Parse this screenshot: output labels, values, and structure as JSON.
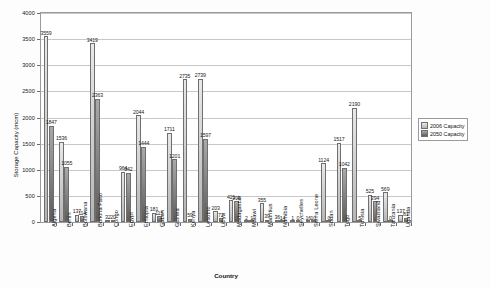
{
  "chart_data": {
    "type": "bar",
    "title": "",
    "xlabel": "Country",
    "ylabel": "Storage Capacity (mcm)",
    "ylim": [
      0,
      4000
    ],
    "ytick_step": 500,
    "yticks": [
      "0",
      "500",
      "1000",
      "1500",
      "2000",
      "2500",
      "3000",
      "3500",
      "4000"
    ],
    "grid": true,
    "legend_position": "right",
    "categories": [
      "Algeria",
      "Benin",
      "Botswana",
      "Burkina Faso",
      "Congo",
      "Egypt",
      "Ethiopia",
      "Gabon",
      "Guinea",
      "Kenya",
      "Lesotho",
      "Libya",
      "Madagascar",
      "Malawi",
      "Mauritius",
      "Namibia",
      "Seychelles",
      "Sierra Leone",
      "Sudan",
      "Togo",
      "Tunisia",
      "Swaziland",
      "Tanzania",
      "Uganda"
    ],
    "series": [
      {
        "name": "2006 Capacity",
        "color": "#d2d2d2",
        "values": [
          3559,
          1536,
          137,
          3419,
          32,
          964,
          2044,
          181,
          1711,
          2735,
          2739,
          203,
          421,
          2,
          355,
          36,
          1,
          16,
          1124,
          1517,
          2190,
          525,
          569,
          137
        ]
      },
      {
        "name": "2050 Capacity",
        "color": "#7a7a7a",
        "values": [
          1847,
          1055,
          114,
          2363,
          20,
          942,
          1444,
          115,
          1201,
          59,
          1597,
          72,
          396,
          1,
          39,
          14,
          0,
          10,
          0,
          1042,
          5,
          394,
          0,
          81
        ]
      }
    ],
    "data_labels": [
      {
        "category": "Algeria",
        "v2006": "3559",
        "v2050": "1847"
      },
      {
        "category": "Benin",
        "v2006": "1536",
        "v2050": "1055"
      },
      {
        "category": "Botswana",
        "v2006": "137",
        "v2050": "114"
      },
      {
        "category": "Burkina Faso",
        "v2006": "3419",
        "v2050": "2363"
      },
      {
        "category": "Congo",
        "v2006": "32",
        "v2050": "20"
      },
      {
        "category": "Egypt",
        "v2006": "964",
        "v2050": "942"
      },
      {
        "category": "Ethiopia",
        "v2006": "2044",
        "v2050": "1444"
      },
      {
        "category": "Gabon",
        "v2006": "181",
        "v2050": "115"
      },
      {
        "category": "Guinea",
        "v2006": "1711",
        "v2050": "1201"
      },
      {
        "category": "Kenya",
        "v2006": "2735",
        "v2050": "59"
      },
      {
        "category": "Lesotho",
        "v2006": "2739",
        "v2050": "1597"
      },
      {
        "category": "Libya",
        "v2006": "203",
        "v2050": "72"
      },
      {
        "category": "Madagascar",
        "v2006": "421",
        "v2050": "396"
      },
      {
        "category": "Malawi",
        "v2006": "2",
        "v2050": "1"
      },
      {
        "category": "Mauritius",
        "v2006": "355",
        "v2050": "39"
      },
      {
        "category": "Namibia",
        "v2006": "36",
        "v2050": "14"
      },
      {
        "category": "Seychelles",
        "v2006": "1",
        "v2050": "0"
      },
      {
        "category": "Sierra Leone",
        "v2006": "16",
        "v2050": "10"
      },
      {
        "category": "Sudan",
        "v2006": "1124",
        "v2050": "0"
      },
      {
        "category": "Togo",
        "v2006": "1517",
        "v2050": "1042"
      },
      {
        "category": "Tunisia",
        "v2006": "2190",
        "v2050": "5"
      },
      {
        "category": "Swaziland",
        "v2006": "525",
        "v2050": "394"
      },
      {
        "category": "Tanzania",
        "v2006": "569",
        "v2050": "0"
      },
      {
        "category": "Uganda",
        "v2006": "137",
        "v2050": "81"
      }
    ]
  },
  "legend": {
    "items": [
      {
        "label": "2006 Capacity"
      },
      {
        "label": "2050 Capacity"
      }
    ]
  }
}
